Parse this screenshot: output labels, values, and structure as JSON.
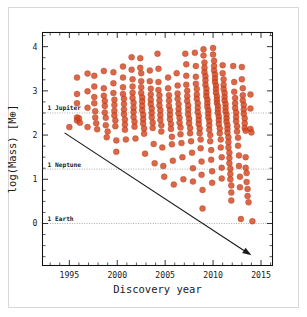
{
  "figure": {
    "background_color": "#ffffff",
    "border_color": "#d8d8d8",
    "marker_color": "#d2451f",
    "refline_color": "#8a8a8a",
    "arrow_color": "#1a1a1a"
  },
  "chart_data": {
    "type": "scatter",
    "title": "",
    "xlabel": "Discovery year",
    "ylabel": "log(Mass) [M⊕]",
    "xlim": [
      1992.2,
      2016.2
    ],
    "ylim": [
      -0.95,
      4.32
    ],
    "xticks": [
      1995,
      2000,
      2005,
      2010,
      2015
    ],
    "xtick_labels": [
      "1995",
      "2000",
      "2005",
      "2010",
      "2015"
    ],
    "yticks": [
      0,
      1,
      2,
      3,
      4
    ],
    "ytick_labels": [
      "0",
      "1",
      "2",
      "3",
      "4"
    ],
    "x_minor_tick_step": 1,
    "y_minor_tick_step": 0.25,
    "grid": false,
    "legend": null,
    "reference_lines": [
      {
        "label": "1 Jupiter",
        "y": 2.5,
        "style": "dotted"
      },
      {
        "label": "1 Neptune",
        "y": 1.23,
        "style": "dotted"
      },
      {
        "label": "1 Earth",
        "y": 0.0,
        "style": "dotted"
      }
    ],
    "annotations": [
      {
        "type": "arrow",
        "label": "",
        "x_start": 1994.5,
        "y_start": 2.05,
        "x_end": 2014.0,
        "y_end": -0.72
      }
    ],
    "marker": {
      "shape": "circle",
      "size": 3.0,
      "color": "#d2451f",
      "alpha": 0.82
    },
    "points": [
      [
        1995.0,
        2.18
      ],
      [
        1995.8,
        3.3
      ],
      [
        1995.8,
        2.93
      ],
      [
        1995.8,
        2.72
      ],
      [
        1995.8,
        2.4
      ],
      [
        1995.8,
        2.33
      ],
      [
        1996.0,
        2.38
      ],
      [
        1996.1,
        2.28
      ],
      [
        1996.9,
        3.39
      ],
      [
        1996.9,
        2.99
      ],
      [
        1996.9,
        2.62
      ],
      [
        1996.9,
        2.18
      ],
      [
        1997.6,
        3.34
      ],
      [
        1997.6,
        3.1
      ],
      [
        1997.6,
        2.86
      ],
      [
        1997.6,
        2.72
      ],
      [
        1997.7,
        2.54
      ],
      [
        1997.7,
        2.4
      ],
      [
        1997.8,
        2.27
      ],
      [
        1997.9,
        2.13
      ],
      [
        1998.6,
        3.45
      ],
      [
        1998.6,
        3.06
      ],
      [
        1998.6,
        2.89
      ],
      [
        1998.7,
        2.77
      ],
      [
        1998.7,
        2.66
      ],
      [
        1998.7,
        2.51
      ],
      [
        1998.8,
        2.39
      ],
      [
        1998.8,
        2.22
      ],
      [
        1998.9,
        1.95
      ],
      [
        1999.0,
        2.08
      ],
      [
        1999.6,
        3.42
      ],
      [
        1999.6,
        3.17
      ],
      [
        1999.6,
        2.95
      ],
      [
        1999.7,
        2.8
      ],
      [
        1999.7,
        2.68
      ],
      [
        1999.7,
        2.55
      ],
      [
        1999.7,
        2.44
      ],
      [
        1999.8,
        2.33
      ],
      [
        1999.8,
        2.2
      ],
      [
        1999.9,
        1.88
      ],
      [
        1999.9,
        1.62
      ],
      [
        2000.6,
        3.55
      ],
      [
        2000.6,
        3.3
      ],
      [
        2000.6,
        3.08
      ],
      [
        2000.6,
        2.93
      ],
      [
        2000.7,
        2.82
      ],
      [
        2000.7,
        2.7
      ],
      [
        2000.7,
        2.58
      ],
      [
        2000.7,
        2.47
      ],
      [
        2000.8,
        2.35
      ],
      [
        2000.8,
        2.24
      ],
      [
        2000.8,
        2.12
      ],
      [
        2000.9,
        1.9
      ],
      [
        2001.5,
        3.76
      ],
      [
        2001.5,
        3.48
      ],
      [
        2001.6,
        3.26
      ],
      [
        2001.6,
        3.1
      ],
      [
        2001.6,
        2.96
      ],
      [
        2001.6,
        2.84
      ],
      [
        2001.7,
        2.73
      ],
      [
        2001.7,
        2.62
      ],
      [
        2001.7,
        2.52
      ],
      [
        2001.7,
        2.41
      ],
      [
        2001.8,
        2.3
      ],
      [
        2001.8,
        2.19
      ],
      [
        2001.9,
        1.92
      ],
      [
        2002.4,
        3.74
      ],
      [
        2002.4,
        3.52
      ],
      [
        2002.5,
        3.4
      ],
      [
        2002.5,
        3.22
      ],
      [
        2002.5,
        3.08
      ],
      [
        2002.5,
        2.95
      ],
      [
        2002.6,
        2.85
      ],
      [
        2002.6,
        2.76
      ],
      [
        2002.6,
        2.66
      ],
      [
        2002.6,
        2.56
      ],
      [
        2002.7,
        2.46
      ],
      [
        2002.7,
        2.36
      ],
      [
        2002.7,
        2.26
      ],
      [
        2002.8,
        2.15
      ],
      [
        2002.8,
        2.03
      ],
      [
        2002.9,
        1.58
      ],
      [
        2003.4,
        3.46
      ],
      [
        2003.4,
        3.22
      ],
      [
        2003.5,
        3.05
      ],
      [
        2003.5,
        2.92
      ],
      [
        2003.5,
        2.8
      ],
      [
        2003.5,
        2.7
      ],
      [
        2003.6,
        2.6
      ],
      [
        2003.6,
        2.5
      ],
      [
        2003.6,
        2.4
      ],
      [
        2003.7,
        2.28
      ],
      [
        2003.7,
        2.16
      ],
      [
        2003.8,
        1.8
      ],
      [
        2003.9,
        1.36
      ],
      [
        2004.2,
        3.84
      ],
      [
        2004.3,
        3.5
      ],
      [
        2004.3,
        3.2
      ],
      [
        2004.3,
        3.02
      ],
      [
        2004.4,
        2.9
      ],
      [
        2004.4,
        2.78
      ],
      [
        2004.4,
        2.67
      ],
      [
        2004.5,
        2.56
      ],
      [
        2004.5,
        2.45
      ],
      [
        2004.5,
        2.34
      ],
      [
        2004.6,
        2.22
      ],
      [
        2004.6,
        2.08
      ],
      [
        2004.7,
        1.72
      ],
      [
        2004.8,
        1.3
      ],
      [
        2004.9,
        1.06
      ],
      [
        2005.3,
        3.3
      ],
      [
        2005.3,
        3.06
      ],
      [
        2005.4,
        2.9
      ],
      [
        2005.4,
        2.78
      ],
      [
        2005.4,
        2.66
      ],
      [
        2005.5,
        2.56
      ],
      [
        2005.5,
        2.46
      ],
      [
        2005.5,
        2.36
      ],
      [
        2005.6,
        2.25
      ],
      [
        2005.6,
        2.14
      ],
      [
        2005.7,
        1.96
      ],
      [
        2005.7,
        1.79
      ],
      [
        2005.8,
        1.42
      ],
      [
        2005.9,
        0.88
      ],
      [
        2006.2,
        3.4
      ],
      [
        2006.3,
        3.12
      ],
      [
        2006.3,
        2.94
      ],
      [
        2006.3,
        2.82
      ],
      [
        2006.4,
        2.7
      ],
      [
        2006.4,
        2.59
      ],
      [
        2006.4,
        2.49
      ],
      [
        2006.5,
        2.39
      ],
      [
        2006.5,
        2.28
      ],
      [
        2006.6,
        2.17
      ],
      [
        2006.6,
        2.02
      ],
      [
        2006.7,
        1.82
      ],
      [
        2006.8,
        1.5
      ],
      [
        2006.9,
        1.0
      ],
      [
        2007.1,
        3.84
      ],
      [
        2007.2,
        3.6
      ],
      [
        2007.2,
        3.34
      ],
      [
        2007.2,
        3.14
      ],
      [
        2007.3,
        3.0
      ],
      [
        2007.3,
        2.88
      ],
      [
        2007.3,
        2.77
      ],
      [
        2007.4,
        2.67
      ],
      [
        2007.4,
        2.57
      ],
      [
        2007.4,
        2.47
      ],
      [
        2007.5,
        2.37
      ],
      [
        2007.5,
        2.27
      ],
      [
        2007.6,
        2.16
      ],
      [
        2007.6,
        2.04
      ],
      [
        2007.7,
        1.86
      ],
      [
        2007.8,
        1.6
      ],
      [
        2007.9,
        1.25
      ],
      [
        2007.9,
        0.95
      ],
      [
        2008.1,
        3.86
      ],
      [
        2008.2,
        3.56
      ],
      [
        2008.2,
        3.32
      ],
      [
        2008.2,
        3.16
      ],
      [
        2008.3,
        3.04
      ],
      [
        2008.3,
        2.92
      ],
      [
        2008.3,
        2.82
      ],
      [
        2008.4,
        2.72
      ],
      [
        2008.4,
        2.62
      ],
      [
        2008.4,
        2.52
      ],
      [
        2008.5,
        2.43
      ],
      [
        2008.5,
        2.34
      ],
      [
        2008.5,
        2.25
      ],
      [
        2008.6,
        2.15
      ],
      [
        2008.6,
        2.04
      ],
      [
        2008.7,
        1.9
      ],
      [
        2008.7,
        1.7
      ],
      [
        2008.8,
        1.4
      ],
      [
        2008.8,
        1.1
      ],
      [
        2008.9,
        0.76
      ],
      [
        2008.9,
        0.34
      ],
      [
        2009.0,
        3.94
      ],
      [
        2009.0,
        3.8
      ],
      [
        2009.1,
        3.64
      ],
      [
        2009.1,
        3.52
      ],
      [
        2009.1,
        3.42
      ],
      [
        2009.2,
        3.33
      ],
      [
        2009.2,
        3.24
      ],
      [
        2009.2,
        3.14
      ],
      [
        2009.3,
        3.05
      ],
      [
        2009.3,
        2.96
      ],
      [
        2009.3,
        2.88
      ],
      [
        2009.4,
        2.8
      ],
      [
        2009.4,
        2.72
      ],
      [
        2009.4,
        2.64
      ],
      [
        2009.5,
        2.56
      ],
      [
        2009.5,
        2.48
      ],
      [
        2009.5,
        2.4
      ],
      [
        2009.6,
        2.32
      ],
      [
        2009.6,
        2.22
      ],
      [
        2009.6,
        2.12
      ],
      [
        2009.7,
        2.0
      ],
      [
        2009.7,
        1.86
      ],
      [
        2009.8,
        1.66
      ],
      [
        2009.8,
        1.44
      ],
      [
        2009.9,
        1.18
      ],
      [
        2009.9,
        0.92
      ],
      [
        2010.0,
        3.97
      ],
      [
        2010.0,
        3.82
      ],
      [
        2010.1,
        3.68
      ],
      [
        2010.1,
        3.56
      ],
      [
        2010.1,
        3.46
      ],
      [
        2010.2,
        3.37
      ],
      [
        2010.2,
        3.28
      ],
      [
        2010.2,
        3.2
      ],
      [
        2010.3,
        3.12
      ],
      [
        2010.3,
        3.04
      ],
      [
        2010.3,
        2.96
      ],
      [
        2010.4,
        2.88
      ],
      [
        2010.4,
        2.8
      ],
      [
        2010.4,
        2.73
      ],
      [
        2010.5,
        2.66
      ],
      [
        2010.5,
        2.58
      ],
      [
        2010.5,
        2.5
      ],
      [
        2010.6,
        2.42
      ],
      [
        2010.6,
        2.34
      ],
      [
        2010.6,
        2.25
      ],
      [
        2010.7,
        2.15
      ],
      [
        2010.7,
        2.04
      ],
      [
        2010.8,
        1.9
      ],
      [
        2010.8,
        1.72
      ],
      [
        2010.9,
        1.5
      ],
      [
        2010.9,
        1.26
      ],
      [
        2010.9,
        1.02
      ],
      [
        2011.0,
        3.58
      ],
      [
        2011.0,
        3.4
      ],
      [
        2011.1,
        3.26
      ],
      [
        2011.1,
        3.14
      ],
      [
        2011.1,
        3.04
      ],
      [
        2011.2,
        2.95
      ],
      [
        2011.2,
        2.86
      ],
      [
        2011.2,
        2.78
      ],
      [
        2011.3,
        2.7
      ],
      [
        2011.3,
        2.62
      ],
      [
        2011.3,
        2.54
      ],
      [
        2011.4,
        2.46
      ],
      [
        2011.4,
        2.38
      ],
      [
        2011.4,
        2.3
      ],
      [
        2011.5,
        2.22
      ],
      [
        2011.5,
        2.14
      ],
      [
        2011.5,
        2.05
      ],
      [
        2011.6,
        1.95
      ],
      [
        2011.6,
        1.84
      ],
      [
        2011.6,
        1.72
      ],
      [
        2011.7,
        1.6
      ],
      [
        2011.7,
        1.48
      ],
      [
        2011.7,
        1.36
      ],
      [
        2011.8,
        1.24
      ],
      [
        2011.8,
        1.12
      ],
      [
        2011.8,
        1.0
      ],
      [
        2011.9,
        0.86
      ],
      [
        2011.9,
        0.7
      ],
      [
        2011.9,
        0.52
      ],
      [
        2012.1,
        3.56
      ],
      [
        2012.2,
        3.2
      ],
      [
        2012.2,
        2.98
      ],
      [
        2012.3,
        2.84
      ],
      [
        2012.3,
        2.72
      ],
      [
        2012.3,
        2.61
      ],
      [
        2012.4,
        2.51
      ],
      [
        2012.4,
        2.41
      ],
      [
        2012.4,
        2.31
      ],
      [
        2012.5,
        2.2
      ],
      [
        2012.5,
        2.08
      ],
      [
        2012.6,
        1.94
      ],
      [
        2012.6,
        1.76
      ],
      [
        2012.7,
        1.54
      ],
      [
        2012.7,
        1.3
      ],
      [
        2012.8,
        1.06
      ],
      [
        2012.8,
        0.82
      ],
      [
        2012.9,
        0.1
      ],
      [
        2013.0,
        3.54
      ],
      [
        2013.0,
        3.26
      ],
      [
        2013.1,
        3.06
      ],
      [
        2013.1,
        2.9
      ],
      [
        2013.1,
        2.78
      ],
      [
        2013.2,
        2.68
      ],
      [
        2013.2,
        2.58
      ],
      [
        2013.2,
        2.48
      ],
      [
        2013.3,
        2.38
      ],
      [
        2013.3,
        2.27
      ],
      [
        2013.3,
        2.16
      ],
      [
        2013.4,
        2.1
      ],
      [
        2013.4,
        1.5
      ],
      [
        2013.4,
        1.26
      ],
      [
        2013.5,
        1.14
      ],
      [
        2013.5,
        0.94
      ],
      [
        2013.6,
        0.78
      ],
      [
        2013.6,
        0.62
      ],
      [
        2013.7,
        0.48
      ],
      [
        2013.9,
        2.92
      ],
      [
        2013.9,
        2.6
      ],
      [
        2013.9,
        2.14
      ],
      [
        2014.0,
        2.06
      ],
      [
        2014.1,
        0.05
      ]
    ]
  }
}
